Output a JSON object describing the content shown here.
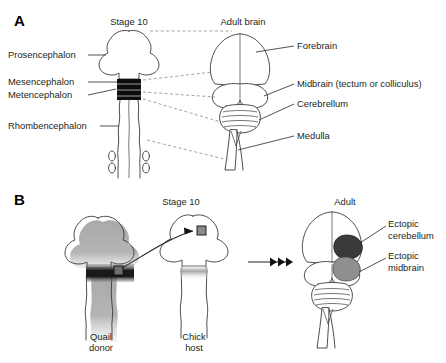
{
  "figure": {
    "panels": [
      {
        "letter": "A",
        "headings": {
          "embryo": "Stage 10",
          "adult": "Adult brain"
        },
        "left_labels": [
          "Prosencephalon",
          "Mesencephalon",
          "Metencephalon",
          "Rhombencephalon"
        ],
        "right_labels": [
          "Forebrain",
          "Midbrain (tectum or colliculus)",
          "Cerebrellum",
          "Medulla"
        ]
      },
      {
        "letter": "B",
        "headings": {
          "embryo": "Stage 10",
          "adult": "Adult"
        },
        "bottom_labels": [
          {
            "line1": "Quail",
            "line2": "donor"
          },
          {
            "line1": "Chick",
            "line2": "host"
          }
        ],
        "right_labels": [
          {
            "line1": "Ectopic",
            "line2": "cerebellum"
          },
          {
            "line1": "Ectopic",
            "line2": "midbrain"
          }
        ]
      }
    ],
    "colors": {
      "isthmus_band": "#0d0d0d",
      "quail_tissue": "#a9a9a9",
      "ectopic_cerebellum": "#3a3a3a",
      "ectopic_midbrain": "#8f8f8f",
      "outline": "#3a3a3a",
      "dashed_connector": "#8c8c8c"
    }
  }
}
